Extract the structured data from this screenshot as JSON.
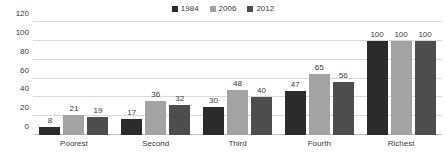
{
  "chart_data": {
    "type": "bar",
    "title": "",
    "subtitle": "",
    "xlabel": "",
    "ylabel": "",
    "categories": [
      "Poorest",
      "Second",
      "Third",
      "Fourth",
      "Richest"
    ],
    "series": [
      {
        "name": "1984",
        "color": "#2b2b2b",
        "values": [
          8,
          17,
          30,
          47,
          100
        ]
      },
      {
        "name": "2006",
        "color": "#a3a3a3",
        "values": [
          21,
          36,
          48,
          65,
          100
        ]
      },
      {
        "name": "2012",
        "color": "#4d4d4d",
        "values": [
          19,
          32,
          40,
          56,
          100
        ]
      }
    ],
    "ylim": [
      0,
      120
    ],
    "yticks": [
      0,
      20,
      40,
      60,
      80,
      100,
      120
    ],
    "ytick_labels": [
      "0",
      "20",
      "40",
      "60",
      "80",
      "100",
      "120"
    ],
    "grid": true,
    "grid_axis": "y",
    "grid_color": "#d9d9d9",
    "legend_position": "top-center",
    "data_labels": true,
    "background_color": "#ffffff",
    "text_color": "#3a3a3a"
  }
}
